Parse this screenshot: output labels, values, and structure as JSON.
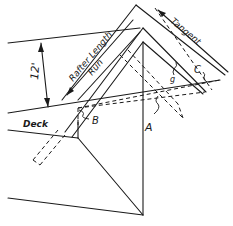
{
  "diagram": {
    "labels": {
      "rise": "12'",
      "rafter_length": "Rafter Length",
      "run": "Run",
      "tangent": "Tangent",
      "deck": "Deck",
      "point_a": "A",
      "point_b": "B",
      "point_c": "C",
      "point_g": "g"
    },
    "colors": {
      "ink": "#1a1a1a",
      "background": "#ffffff"
    }
  }
}
